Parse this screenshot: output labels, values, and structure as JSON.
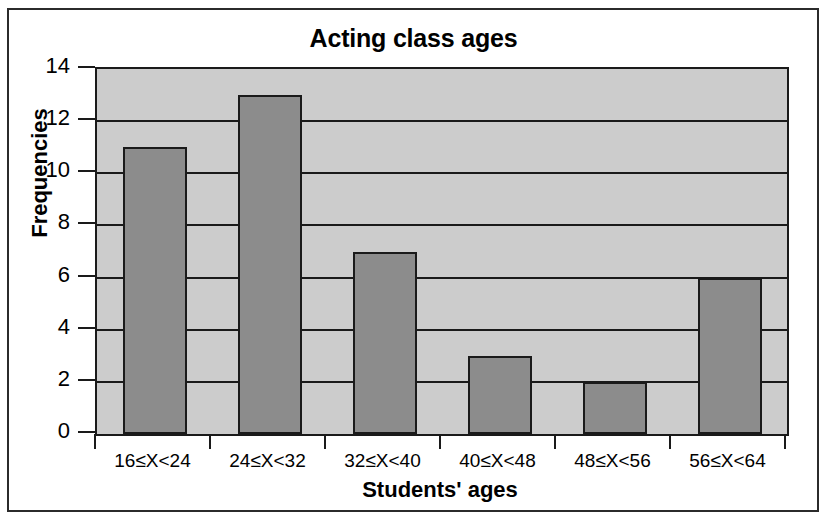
{
  "chart_data": {
    "type": "bar",
    "title": "Acting class ages",
    "xlabel": "Students' ages",
    "ylabel": "Frequencies",
    "categories": [
      "16≤X<24",
      "24≤X<32",
      "32≤X<40",
      "40≤X<48",
      "48≤X<56",
      "56≤X<64"
    ],
    "values": [
      11,
      13,
      7,
      3,
      2,
      6
    ],
    "ylim": [
      0,
      14
    ],
    "ytick_labels": [
      "14",
      "12",
      "10",
      "8",
      "6",
      "4",
      "2",
      "0"
    ],
    "ytick_values": [
      14,
      12,
      10,
      8,
      6,
      4,
      2,
      0
    ],
    "grid": true,
    "legend": null,
    "colors": {
      "bar_fill": "#8c8c8c",
      "bar_edge": "#1a1a1a",
      "plot_background": "#cccccc",
      "gridline": "#1a1a1a",
      "figure_background": "#ffffff",
      "frame": "#2b2b2b",
      "text": "#000000"
    }
  }
}
